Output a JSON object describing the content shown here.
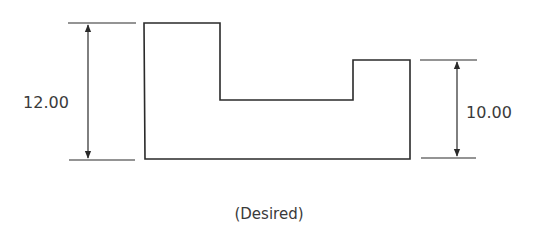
{
  "diagram": {
    "caption": "(Desired)",
    "left_dimension": {
      "value": "12.00"
    },
    "right_dimension": {
      "value": "10.00"
    },
    "stroke_color": "#2a2a2a",
    "text_color": "#3a3a3a"
  }
}
